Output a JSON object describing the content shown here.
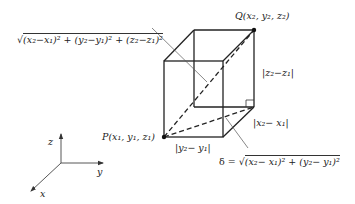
{
  "diagram": {
    "points": {
      "P": {
        "label": "P(x",
        "full": "P(x1, y1, z1)"
      },
      "Q": {
        "full": "Q(x2, y2, z2)"
      }
    },
    "labels": {
      "Q_label": "Q(x₂, y₂, z₂)",
      "P_label": "P(x₁, y₁, z₁)",
      "z_diff": "|z₂−z₁|",
      "x_diff": "|x₂− x₁|",
      "y_diff": "|y₂− y₁|",
      "space_diagonal": "√",
      "space_diagonal_expr": "(x₂−x₁)² + (y₂−y₁)² + (z₂−z₁)²",
      "delta_prefix": "δ = √",
      "delta_expr": "(x₂− x₁)² + (y₂− y₁)²"
    },
    "axes": {
      "x": "x",
      "y": "y",
      "z": "z"
    },
    "colors": {
      "line": "#222222",
      "leader": "#555555",
      "background": "#ffffff"
    }
  }
}
